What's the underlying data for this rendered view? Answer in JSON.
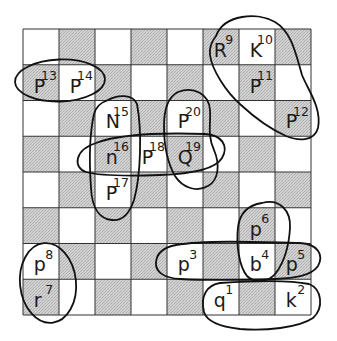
{
  "board": {
    "origin_x": 23,
    "origin_y": 29,
    "square_w": 36,
    "square_h": 35.75,
    "files": 8,
    "ranks": 8,
    "top_left_square": "light",
    "colors": {
      "light": "#ffffff",
      "dark": "#c9c9c9",
      "grid": "#333333",
      "ink": "#111111"
    }
  },
  "pieces": [
    {
      "id": "piece-1",
      "letter": "q",
      "number": "1",
      "col": 5,
      "row": 7
    },
    {
      "id": "piece-2",
      "letter": "k",
      "number": "2",
      "col": 7,
      "row": 7
    },
    {
      "id": "piece-3",
      "letter": "p",
      "number": "3",
      "col": 4,
      "row": 6
    },
    {
      "id": "piece-4",
      "letter": "b",
      "number": "4",
      "col": 6,
      "row": 6
    },
    {
      "id": "piece-5",
      "letter": "p",
      "number": "5",
      "col": 7,
      "row": 6
    },
    {
      "id": "piece-6",
      "letter": "p",
      "number": "6",
      "col": 6,
      "row": 5
    },
    {
      "id": "piece-7",
      "letter": "r",
      "number": "7",
      "col": 0,
      "row": 7
    },
    {
      "id": "piece-8",
      "letter": "p",
      "number": "8",
      "col": 0,
      "row": 6
    },
    {
      "id": "piece-9",
      "letter": "R",
      "number": "9",
      "col": 5,
      "row": 0
    },
    {
      "id": "piece-10",
      "letter": "K",
      "number": "10",
      "col": 6,
      "row": 0
    },
    {
      "id": "piece-11",
      "letter": "P",
      "number": "11",
      "col": 6,
      "row": 1
    },
    {
      "id": "piece-12",
      "letter": "P",
      "number": "12",
      "col": 7,
      "row": 2
    },
    {
      "id": "piece-13",
      "letter": "P",
      "number": "13",
      "col": 0,
      "row": 1
    },
    {
      "id": "piece-14",
      "letter": "P",
      "number": "14",
      "col": 1,
      "row": 1
    },
    {
      "id": "piece-15",
      "letter": "N",
      "number": "15",
      "col": 2,
      "row": 2
    },
    {
      "id": "piece-16",
      "letter": "n",
      "number": "16",
      "col": 2,
      "row": 3
    },
    {
      "id": "piece-17",
      "letter": "P",
      "number": "17",
      "col": 2,
      "row": 4
    },
    {
      "id": "piece-18",
      "letter": "P",
      "number": "18",
      "col": 3,
      "row": 3
    },
    {
      "id": "piece-19",
      "letter": "Q",
      "number": "19",
      "col": 4,
      "row": 3
    },
    {
      "id": "piece-20",
      "letter": "P",
      "number": "20",
      "col": 4,
      "row": 2
    }
  ],
  "groups": [
    {
      "name": "group-13-14",
      "members": [
        "13",
        "14"
      ]
    },
    {
      "name": "group-9-10-11-12",
      "members": [
        "9",
        "10",
        "11",
        "12"
      ]
    },
    {
      "name": "group-15-16-17",
      "members": [
        "15",
        "16",
        "17"
      ]
    },
    {
      "name": "group-16-18-19",
      "members": [
        "16",
        "18",
        "19"
      ]
    },
    {
      "name": "group-20-19",
      "members": [
        "20",
        "19"
      ]
    },
    {
      "name": "group-8-7",
      "members": [
        "8",
        "7"
      ]
    },
    {
      "name": "group-6-4",
      "members": [
        "6",
        "4"
      ]
    },
    {
      "name": "group-3-4-5",
      "members": [
        "3",
        "4",
        "5"
      ]
    },
    {
      "name": "group-1-2",
      "members": [
        "1",
        "2"
      ]
    }
  ]
}
